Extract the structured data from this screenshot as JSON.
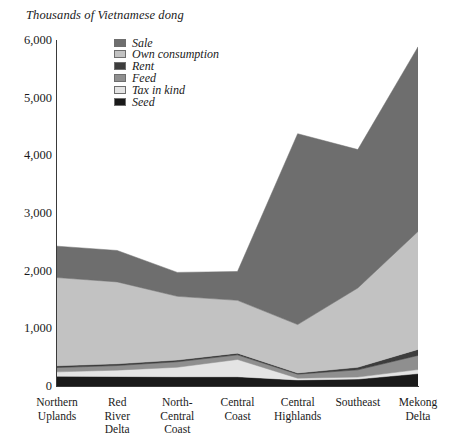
{
  "axis_title": "Thousands of Vietnamese dong",
  "legend": {
    "items": [
      {
        "label": "Sale",
        "color": "#6e6e6e"
      },
      {
        "label": "Own consumption",
        "color": "#c2c2c2"
      },
      {
        "label": "Rent",
        "color": "#3d3d3d"
      },
      {
        "label": "Feed",
        "color": "#8f8f8f"
      },
      {
        "label": "Tax in kind",
        "color": "#e4e4e4"
      },
      {
        "label": "Seed",
        "color": "#1a1a1a"
      }
    ]
  },
  "chart_data": {
    "type": "area",
    "stacked": true,
    "title": "Thousands of Vietnamese dong",
    "xlabel": "",
    "ylabel": "Thousands of Vietnamese dong",
    "ylim": [
      0,
      6000
    ],
    "yticks": [
      "0",
      "1,000",
      "2,000",
      "3,000",
      "4,000",
      "5,000",
      "6,000"
    ],
    "ytick_values": [
      0,
      1000,
      2000,
      3000,
      4000,
      5000,
      6000
    ],
    "grid": false,
    "legend_position": "top-left-inside",
    "categories": [
      "Northern\nUplands",
      "Red\nRiver\nDelta",
      "North-\nCentral\nCoast",
      "Central\nCoast",
      "Central\nHighlands",
      "Southeast",
      "Mekong\nDelta"
    ],
    "stack_order_bottom_to_top": [
      "Seed",
      "Tax in kind",
      "Feed",
      "Rent",
      "Own consumption",
      "Sale"
    ],
    "series": [
      {
        "name": "Seed",
        "color": "#1a1a1a",
        "values": [
          170,
          165,
          160,
          160,
          105,
          120,
          215
        ]
      },
      {
        "name": "Tax in kind",
        "color": "#e4e4e4",
        "values": [
          75,
          110,
          165,
          300,
          30,
          35,
          70
        ]
      },
      {
        "name": "Feed",
        "color": "#8f8f8f",
        "values": [
          75,
          80,
          95,
          80,
          70,
          125,
          245
        ]
      },
      {
        "name": "Rent",
        "color": "#3d3d3d",
        "values": [
          30,
          30,
          30,
          30,
          20,
          45,
          105
        ]
      },
      {
        "name": "Own consumption",
        "color": "#c2c2c2",
        "values": [
          1530,
          1420,
          1105,
          915,
          840,
          1375,
          2045
        ]
      },
      {
        "name": "Sale",
        "color": "#6e6e6e",
        "values": [
          545,
          545,
          415,
          500,
          3310,
          2400,
          3200
        ]
      }
    ],
    "totals": [
      2425,
      2350,
      1970,
      1985,
      4375,
      4100,
      5880
    ]
  }
}
